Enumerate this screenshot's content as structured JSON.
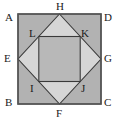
{
  "figure": {
    "type": "geometry-diagram",
    "background_color": "#ffffff",
    "outer_square": {
      "name": "ABCD",
      "fill_color": "#b3b3b3",
      "stroke_color": "#4d4d4d",
      "x": 18,
      "y": 14,
      "width": 83,
      "height": 90
    },
    "diamond": {
      "name": "EHGF",
      "fill_color": "#d4d4d4",
      "stroke_color": "#3a3a3a"
    },
    "inner_square": {
      "name": "LKJI",
      "fill_color": "#b8b8b8",
      "stroke_color": "#3a3a3a"
    },
    "points": [
      {
        "id": "A",
        "label": "A",
        "role": "outer-square-top-left-vertex",
        "px": 59.5,
        "py": 14,
        "lx": 5,
        "ly": 12
      },
      {
        "id": "D",
        "label": "D",
        "role": "outer-square-top-right-vertex",
        "px": 101,
        "py": 14,
        "lx": 104,
        "ly": 12
      },
      {
        "id": "B",
        "label": "B",
        "role": "outer-square-bottom-left-vertex",
        "px": 18,
        "py": 104,
        "lx": 5,
        "ly": 97
      },
      {
        "id": "C",
        "label": "C",
        "role": "outer-square-bottom-right-vertex",
        "px": 101,
        "py": 104,
        "lx": 104,
        "ly": 97
      },
      {
        "id": "H",
        "label": "H",
        "role": "top-side-midpoint",
        "px": 59.5,
        "py": 14,
        "lx": 56,
        "ly": 1
      },
      {
        "id": "G",
        "label": "G",
        "role": "right-side-midpoint",
        "px": 101,
        "py": 59,
        "lx": 104,
        "ly": 53
      },
      {
        "id": "F",
        "label": "F",
        "role": "bottom-side-midpoint",
        "px": 59.5,
        "py": 104,
        "lx": 56,
        "ly": 108
      },
      {
        "id": "E",
        "label": "E",
        "role": "left-side-midpoint",
        "px": 18,
        "py": 59,
        "lx": 4,
        "ly": 53
      },
      {
        "id": "L",
        "label": "L",
        "role": "inner-square-top-left-vertex",
        "px": 38.8,
        "py": 36.5,
        "lx": 29,
        "ly": 28
      },
      {
        "id": "K",
        "label": "K",
        "role": "inner-square-top-right-vertex",
        "px": 80.2,
        "py": 36.5,
        "lx": 81,
        "ly": 28
      },
      {
        "id": "J",
        "label": "J",
        "role": "inner-square-bottom-right-vertex",
        "px": 80.2,
        "py": 81.5,
        "lx": 81,
        "ly": 83
      },
      {
        "id": "I",
        "label": "I",
        "role": "inner-square-bottom-left-vertex",
        "px": 38.8,
        "py": 81.5,
        "lx": 30,
        "ly": 83
      }
    ]
  }
}
